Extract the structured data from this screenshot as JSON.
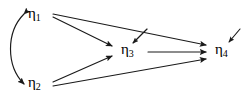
{
  "diagram": {
    "kind": "path-diagram",
    "background_color": "#ffffff",
    "stroke_color": "#1a1a1a",
    "nodes": [
      {
        "id": "eta1",
        "symbol": "η",
        "subscript": "1",
        "label": "η1",
        "x": 38,
        "y": 14
      },
      {
        "id": "eta2",
        "symbol": "η",
        "subscript": "2",
        "label": "η2",
        "x": 38,
        "y": 84
      },
      {
        "id": "eta3",
        "symbol": "η",
        "subscript": "3",
        "label": "η3",
        "x": 131,
        "y": 51
      },
      {
        "id": "eta4",
        "symbol": "η",
        "subscript": "4",
        "label": "η4",
        "x": 225,
        "y": 51
      }
    ],
    "directed_paths": [
      {
        "id": "eta1-to-eta3",
        "from": "eta1",
        "to": "eta3"
      },
      {
        "id": "eta1-to-eta4",
        "from": "eta1",
        "to": "eta4"
      },
      {
        "id": "eta2-to-eta3",
        "from": "eta2",
        "to": "eta3"
      },
      {
        "id": "eta2-to-eta4",
        "from": "eta2",
        "to": "eta4"
      },
      {
        "id": "eta3-to-eta4",
        "from": "eta3",
        "to": "eta4"
      }
    ],
    "covariances": [
      {
        "id": "eta1-eta2-covariance",
        "between": [
          "eta1",
          "eta2"
        ],
        "style": "curved-double-headed"
      }
    ],
    "disturbances": [
      {
        "id": "eta3-disturbance",
        "target": "eta3"
      },
      {
        "id": "eta4-disturbance",
        "target": "eta4"
      }
    ]
  }
}
